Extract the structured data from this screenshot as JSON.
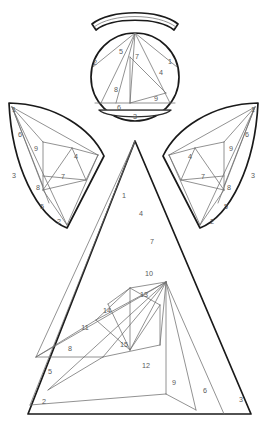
{
  "document": {
    "title": "Angel Patchwork Pattern",
    "type": "line-art-sewing-pattern",
    "background_color": "#ffffff",
    "outline_color": "#1a1a1a",
    "seam_color": "#6e6e6e",
    "number_color": "#5a5a5a",
    "canvas": {
      "width": 270,
      "height": 424
    }
  },
  "parts": {
    "halo": {
      "name": "halo",
      "label": ""
    },
    "head": {
      "name": "head",
      "label": ""
    },
    "collar": {
      "name": "collar",
      "label": ""
    },
    "left_wing": {
      "name": "left-wing",
      "label": ""
    },
    "right_wing": {
      "name": "right-wing",
      "label": ""
    },
    "body": {
      "name": "body",
      "label": ""
    }
  },
  "piece_numbers": {
    "head": [
      "1",
      "2",
      "3",
      "4",
      "5",
      "6",
      "7",
      "8",
      "9"
    ],
    "left_wing": [
      "1",
      "2",
      "3",
      "4",
      "5",
      "6",
      "7",
      "8",
      "9"
    ],
    "right_wing": [
      "1",
      "2",
      "3",
      "4",
      "5",
      "6",
      "7",
      "8",
      "9"
    ],
    "body": [
      "1",
      "2",
      "3",
      "4",
      "5",
      "6",
      "7",
      "8",
      "9",
      "10",
      "11",
      "12",
      "13",
      "14",
      "15"
    ]
  },
  "labels": {
    "head": [
      {
        "text": "1",
        "x": 170,
        "y": 62
      },
      {
        "text": "2",
        "x": 95,
        "y": 63
      },
      {
        "text": "3",
        "x": 135,
        "y": 117
      },
      {
        "text": "4",
        "x": 161,
        "y": 73
      },
      {
        "text": "5",
        "x": 121,
        "y": 52
      },
      {
        "text": "6",
        "x": 119,
        "y": 108
      },
      {
        "text": "7",
        "x": 137,
        "y": 57
      },
      {
        "text": "8",
        "x": 116,
        "y": 90
      },
      {
        "text": "9",
        "x": 156,
        "y": 99
      }
    ],
    "left_wing": [
      {
        "text": "1",
        "x": 14,
        "y": 110
      },
      {
        "text": "2",
        "x": 59,
        "y": 222
      },
      {
        "text": "3",
        "x": 14,
        "y": 176
      },
      {
        "text": "4",
        "x": 76,
        "y": 157
      },
      {
        "text": "5",
        "x": 42,
        "y": 207
      },
      {
        "text": "6",
        "x": 20,
        "y": 135
      },
      {
        "text": "7",
        "x": 63,
        "y": 177
      },
      {
        "text": "8",
        "x": 38,
        "y": 188
      },
      {
        "text": "9",
        "x": 36,
        "y": 149
      }
    ],
    "right_wing": [
      {
        "text": "1",
        "x": 253,
        "y": 110
      },
      {
        "text": "2",
        "x": 212,
        "y": 222
      },
      {
        "text": "3",
        "x": 253,
        "y": 176
      },
      {
        "text": "4",
        "x": 190,
        "y": 157
      },
      {
        "text": "5",
        "x": 226,
        "y": 207
      },
      {
        "text": "6",
        "x": 247,
        "y": 135
      },
      {
        "text": "7",
        "x": 203,
        "y": 177
      },
      {
        "text": "8",
        "x": 229,
        "y": 188
      },
      {
        "text": "9",
        "x": 231,
        "y": 149
      }
    ],
    "body": [
      {
        "text": "1",
        "x": 124,
        "y": 196
      },
      {
        "text": "2",
        "x": 44,
        "y": 402
      },
      {
        "text": "3",
        "x": 241,
        "y": 400
      },
      {
        "text": "4",
        "x": 141,
        "y": 214
      },
      {
        "text": "5",
        "x": 50,
        "y": 372
      },
      {
        "text": "6",
        "x": 205,
        "y": 391
      },
      {
        "text": "7",
        "x": 152,
        "y": 242
      },
      {
        "text": "8",
        "x": 70,
        "y": 349
      },
      {
        "text": "9",
        "x": 174,
        "y": 383
      },
      {
        "text": "10",
        "x": 149,
        "y": 274
      },
      {
        "text": "11",
        "x": 85,
        "y": 328
      },
      {
        "text": "12",
        "x": 146,
        "y": 366
      },
      {
        "text": "13",
        "x": 144,
        "y": 295
      },
      {
        "text": "14",
        "x": 107,
        "y": 311
      },
      {
        "text": "15",
        "x": 124,
        "y": 345
      }
    ]
  }
}
